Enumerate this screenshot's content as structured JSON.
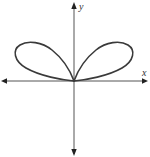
{
  "diagram": {
    "type": "polar-curve",
    "axes": {
      "x_label": "x",
      "y_label": "y"
    },
    "colors": {
      "curve": "#3a3a3a",
      "axis": "#555555",
      "background": "#ffffff"
    }
  }
}
